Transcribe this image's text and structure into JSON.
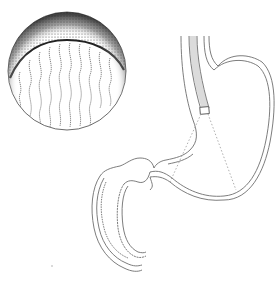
{
  "illustration": {
    "subject": "stomach with endoscope and magnified mucosa inset",
    "colors": {
      "background": "#ffffff",
      "line": "#6e6e6e",
      "stipple": "#3a3a3a",
      "dotted": "#9a9a9a"
    },
    "parts": [
      "magnified-inset",
      "esophagus",
      "endoscope",
      "stomach",
      "duodenum",
      "field-of-view-lines"
    ]
  }
}
